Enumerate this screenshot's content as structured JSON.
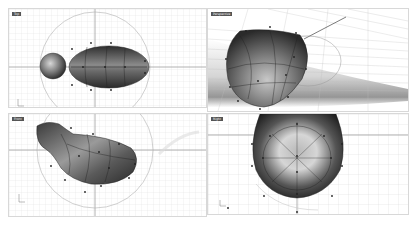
{
  "app": "Rhino 3D modeling viewports",
  "viewports": [
    {
      "id": "top",
      "label": "Top"
    },
    {
      "id": "perspective",
      "label": "Perspective"
    },
    {
      "id": "front",
      "label": "Front"
    },
    {
      "id": "right",
      "label": "Right"
    }
  ],
  "colors": {
    "grid_minor": "#dcdcdc",
    "grid_major": "#b8b8b8",
    "axis": "#9a9a9a",
    "surface_dark": "#3a3a3a",
    "surface_light": "#d0d0d0",
    "control_point": "#222222",
    "background": "#ffffff"
  }
}
